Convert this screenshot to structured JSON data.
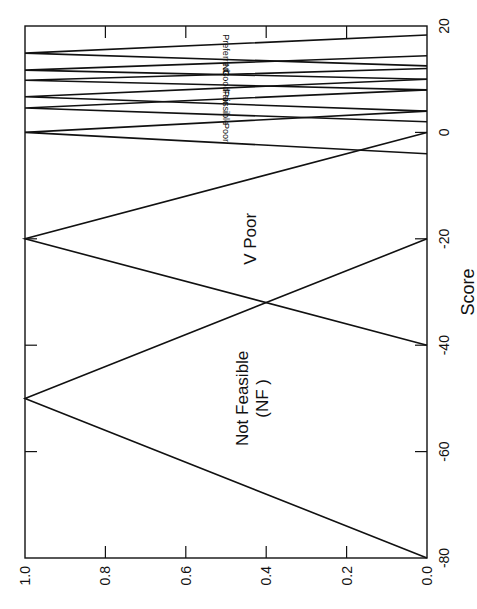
{
  "chart_data": {
    "type": "line",
    "title": "",
    "xlabel": "Score",
    "ylabel": "",
    "orientation": "rotated 90° clockwise (score axis vertical, membership horizontal)",
    "xlim": [
      -80,
      20
    ],
    "ylim": [
      0.0,
      1.0
    ],
    "x_ticks": [
      "-80",
      "-60",
      "-40",
      "-20",
      "0",
      "20"
    ],
    "y_ticks": [
      "0.0",
      "0.2",
      "0.4",
      "0.6",
      "0.8",
      "1.0"
    ],
    "grid": false,
    "legend": "none (inline labels)",
    "series": [
      {
        "name": "Not Feasible (NF)",
        "label_lines": [
          "Not Feasible",
          "(NF )"
        ],
        "x": [
          -80,
          -50,
          -20
        ],
        "values": [
          0,
          1,
          0
        ],
        "label_size": 17
      },
      {
        "name": "V Poor",
        "label_lines": [
          "V Poor"
        ],
        "x": [
          -40,
          -20,
          0
        ],
        "values": [
          0,
          1,
          0
        ],
        "label_size": 17
      },
      {
        "name": "Poor",
        "label_lines": [
          "Poor"
        ],
        "x": [
          -4,
          0,
          4
        ],
        "values": [
          0,
          1,
          0
        ],
        "label_size": 9,
        "upside_down": true
      },
      {
        "name": "Possible",
        "label_lines": [
          "Possible"
        ],
        "x": [
          2,
          4.6,
          8
        ],
        "values": [
          0,
          1,
          0
        ],
        "label_size": 9,
        "upside_down": true
      },
      {
        "name": "Fair",
        "label_lines": [
          "Fair"
        ],
        "x": [
          4,
          6.7,
          10
        ],
        "values": [
          0,
          1,
          0
        ],
        "label_size": 9,
        "upside_down": true
      },
      {
        "name": "Good",
        "label_lines": [
          "Good"
        ],
        "x": [
          8,
          9.8,
          12
        ],
        "values": [
          0,
          1,
          0
        ],
        "label_size": 9,
        "upside_down": true
      },
      {
        "name": "NC",
        "label_lines": [
          "NC"
        ],
        "x": [
          10,
          11.7,
          14.4
        ],
        "values": [
          0,
          1,
          0
        ],
        "label_size": 9,
        "upside_down": true
      },
      {
        "name": "Preferred",
        "label_lines": [
          "Preferred"
        ],
        "x": [
          12.5,
          14.9,
          18.3
        ],
        "values": [
          0,
          1,
          0
        ],
        "label_size": 9,
        "upside_down": true
      }
    ]
  }
}
